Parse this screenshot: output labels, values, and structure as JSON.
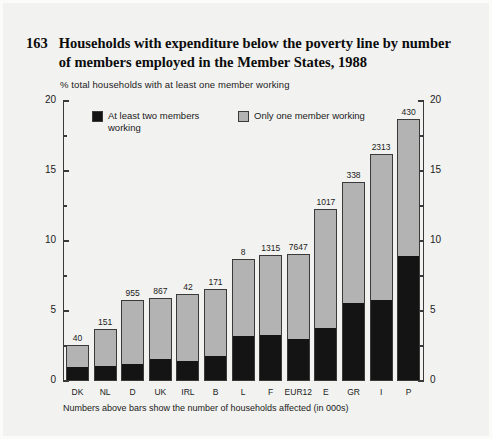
{
  "figure": {
    "number": "163",
    "title": "Households with expenditure below the poverty line by number of members employed in the Member States, 1988",
    "subtitle": "% total households with at least one member working",
    "footnote": "Numbers above bars show the number of households affected (in 000s)"
  },
  "legend": {
    "items": [
      {
        "label": "At least two members working",
        "color": "#141414",
        "name": "at-least-two-members-working"
      },
      {
        "label": "Only one member working",
        "color": "#b3b3b3",
        "name": "only-one-member-working"
      }
    ]
  },
  "axis": {
    "left_ticks": [
      "20",
      "15",
      "10",
      "5",
      "0"
    ],
    "right_ticks": [
      "20",
      "15",
      "10",
      "5",
      "0"
    ],
    "tick_values": [
      20,
      15,
      10,
      5,
      0
    ],
    "minor_tick_values": [
      17.5,
      12.5,
      7.5,
      2.5
    ]
  },
  "chart_data": {
    "type": "bar",
    "subtype": "stacked-vertical",
    "title": "Households with expenditure below the poverty line by number of members employed in the Member States, 1988",
    "subtitle": "% total households with at least one member working",
    "xlabel": "",
    "ylabel": "% total households with at least one member working",
    "ylim": [
      0,
      20
    ],
    "yticks": [
      0,
      5,
      10,
      15,
      20
    ],
    "grid": false,
    "legend_position": "top-left inside plot",
    "dual_axis": true,
    "categories": [
      "DK",
      "NL",
      "D",
      "UK",
      "IRL",
      "B",
      "L",
      "F",
      "EUR12",
      "E",
      "GR",
      "I",
      "P"
    ],
    "series": [
      {
        "name": "At least two members working",
        "color": "#141414",
        "values": [
          1.0,
          1.1,
          1.2,
          1.6,
          1.4,
          1.8,
          3.2,
          3.3,
          3.0,
          3.8,
          5.6,
          5.8,
          8.9
        ]
      },
      {
        "name": "Only one member working",
        "color": "#b3b3b3",
        "values": [
          1.6,
          2.6,
          4.6,
          4.3,
          4.8,
          4.8,
          5.5,
          5.7,
          6.1,
          8.5,
          8.6,
          10.4,
          9.8
        ]
      }
    ],
    "totals": [
      2.6,
      3.7,
      5.8,
      5.9,
      6.2,
      6.6,
      8.7,
      9.0,
      9.1,
      12.3,
      14.2,
      16.2,
      18.7
    ],
    "bar_labels": [
      "40",
      "151",
      "955",
      "867",
      "42",
      "171",
      "8",
      "1315",
      "7647",
      "1017",
      "338",
      "2313",
      "430"
    ],
    "bar_label_meaning": "Numbers above bars show the number of households affected (in 000s)",
    "annotations": [
      "Numbers above bars show the number of households affected (in 000s)"
    ]
  }
}
